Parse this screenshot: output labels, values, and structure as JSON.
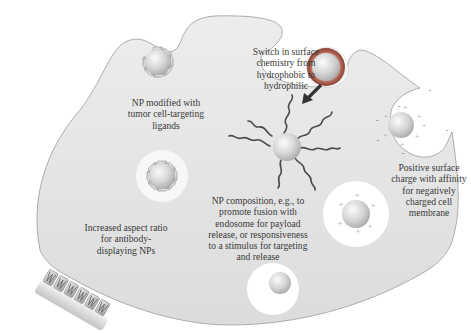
{
  "diagram": {
    "colors": {
      "background": "#ffffff",
      "cell_fill": "#e4e4e4",
      "cell_outline": "#9a9a9a",
      "np_core": "#d8d8d8",
      "ring": "#a85a4a",
      "polymer": "#4a4a4a",
      "arrow": "#333333",
      "text": "#3a3a3a"
    },
    "labels": {
      "ligands": "NP modified with\ntumor cell-targeting\nligands",
      "surface_chemistry": "Switch in surface\nchemistry from\nhydrophobic to\nhydrophilic",
      "aspect_ratio": "Increased aspect ratio\nfor antibody-\ndisplaying NPs",
      "composition": "NP composition, e.g., to\npromote fusion with\nendosome for payload\nrelease, or responsiveness\nto a stimulus for targeting\nand release",
      "surface_charge": "Positive surface\ncharge with affinity\nfor negatively\ncharged cell\nmembrane"
    },
    "symbols": {
      "positive_charge": "+",
      "negative_charge": "-"
    }
  }
}
